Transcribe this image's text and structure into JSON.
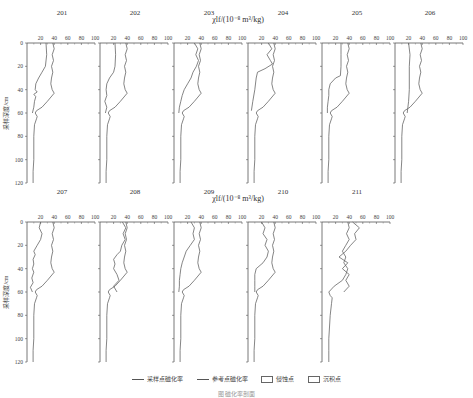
{
  "chart_data": {
    "type": "line",
    "xlabel": "χlf/(10⁻⁸ m³/kg)",
    "ylabel": "采样深度/cm",
    "x_ticks": [
      20,
      40,
      60,
      80,
      100
    ],
    "y_ticks": [
      0,
      20,
      40,
      60,
      80,
      100,
      120
    ],
    "xlim": [
      0,
      100
    ],
    "ylim": [
      0,
      120
    ],
    "y_inverted": true,
    "legend": [
      {
        "type": "line",
        "label": "采样点磁化率"
      },
      {
        "type": "line",
        "label": "参考点磁化率"
      },
      {
        "type": "box",
        "label": "侵蚀点"
      },
      {
        "type": "box",
        "label": "沉积点"
      }
    ],
    "reference_series": {
      "name": "参考点磁化率",
      "depth": [
        0,
        5,
        10,
        15,
        20,
        25,
        30,
        35,
        40,
        43,
        50,
        55,
        58,
        60,
        63,
        65,
        70,
        80,
        90,
        100,
        110,
        120
      ],
      "value": [
        38,
        40,
        37,
        39,
        36,
        38,
        36,
        35,
        37,
        40,
        30,
        22,
        14,
        12,
        15,
        14,
        11,
        10,
        10,
        10,
        9,
        9
      ]
    },
    "panels": [
      {
        "id": "201",
        "row": 0,
        "col": 0,
        "sample": {
          "depth": [
            0,
            10,
            20,
            25,
            30,
            35,
            40,
            42,
            44,
            46,
            50,
            55,
            60
          ],
          "value": [
            28,
            29,
            27,
            22,
            17,
            13,
            12,
            15,
            10,
            13,
            11,
            10,
            8
          ]
        }
      },
      {
        "id": "202",
        "row": 0,
        "col": 1,
        "sample": {
          "depth": [
            0,
            10,
            20,
            25,
            30,
            35,
            40,
            45,
            50,
            55,
            60
          ],
          "value": [
            22,
            23,
            22,
            20,
            14,
            10,
            9,
            10,
            7,
            10,
            8
          ]
        }
      },
      {
        "id": "203",
        "row": 0,
        "col": 2,
        "sample": {
          "depth": [
            0,
            5,
            10,
            15,
            20,
            25,
            30,
            35,
            40,
            45,
            50,
            55,
            60
          ],
          "value": [
            30,
            35,
            32,
            36,
            33,
            28,
            25,
            20,
            15,
            12,
            10,
            8,
            7
          ]
        }
      },
      {
        "id": "204",
        "row": 0,
        "col": 3,
        "sample": {
          "depth": [
            0,
            5,
            10,
            15,
            18,
            22,
            25,
            30,
            40,
            50,
            58
          ],
          "value": [
            30,
            35,
            28,
            33,
            36,
            25,
            14,
            12,
            10,
            7,
            5
          ]
        }
      },
      {
        "id": "205",
        "row": 0,
        "col": 4,
        "sample": {
          "depth": [
            0,
            10,
            20,
            28,
            30,
            35,
            40,
            45,
            50,
            55,
            60
          ],
          "value": [
            28,
            28,
            28,
            27,
            20,
            12,
            10,
            10,
            9,
            8,
            8
          ]
        }
      },
      {
        "id": "206",
        "row": 0,
        "col": 5,
        "sample": {
          "depth": [
            0,
            10,
            20,
            30,
            40,
            50,
            55,
            60
          ],
          "value": [
            20,
            22,
            21,
            21,
            21,
            20,
            19,
            18
          ]
        }
      },
      {
        "id": "207",
        "row": 1,
        "col": 0,
        "sample": {
          "depth": [
            0,
            5,
            10,
            15,
            20,
            25,
            28,
            32,
            36,
            40,
            43,
            48,
            52,
            56,
            60
          ],
          "value": [
            20,
            18,
            22,
            20,
            15,
            10,
            12,
            9,
            10,
            8,
            10,
            7,
            9,
            5,
            8
          ]
        }
      },
      {
        "id": "208",
        "row": 1,
        "col": 1,
        "sample": {
          "depth": [
            0,
            5,
            10,
            15,
            20,
            25,
            28,
            32,
            36,
            40,
            45,
            50,
            55,
            60
          ],
          "value": [
            33,
            38,
            34,
            37,
            32,
            30,
            25,
            20,
            22,
            20,
            25,
            28,
            20,
            25
          ]
        }
      },
      {
        "id": "209",
        "row": 1,
        "col": 2,
        "sample": {
          "depth": [
            0,
            5,
            10,
            15,
            20,
            25,
            30,
            35,
            40,
            45,
            50,
            55,
            60
          ],
          "value": [
            25,
            30,
            28,
            30,
            24,
            18,
            15,
            12,
            10,
            9,
            8,
            8,
            7
          ]
        }
      },
      {
        "id": "210",
        "row": 1,
        "col": 3,
        "sample": {
          "depth": [
            0,
            5,
            10,
            15,
            20,
            25,
            30,
            35,
            40,
            45,
            50,
            55,
            60
          ],
          "value": [
            20,
            25,
            22,
            28,
            25,
            30,
            28,
            22,
            12,
            10,
            10,
            10,
            10
          ]
        }
      },
      {
        "id": "211",
        "row": 1,
        "col": 4,
        "sample": {
          "depth": [
            0,
            5,
            10,
            15,
            20,
            25,
            30,
            35,
            40,
            45,
            50,
            55,
            60
          ],
          "value": [
            45,
            55,
            48,
            50,
            42,
            35,
            25,
            38,
            30,
            40,
            35,
            40,
            32
          ]
        },
        "reference_override": {
          "depth": [
            0,
            5,
            10,
            15,
            20,
            25,
            30,
            35,
            40,
            45,
            50,
            55,
            60,
            63,
            65,
            70,
            80,
            90,
            100,
            110,
            120
          ],
          "value": [
            38,
            40,
            36,
            40,
            35,
            30,
            35,
            32,
            38,
            35,
            30,
            18,
            10,
            12,
            15,
            14,
            12,
            11,
            10,
            10,
            10
          ]
        }
      }
    ]
  },
  "legend": {
    "items": [
      {
        "label": "采样点磁化率"
      },
      {
        "label": "参考点磁化率"
      },
      {
        "label": "侵蚀点"
      },
      {
        "label": "沉积点"
      }
    ]
  },
  "caption": "图    磁化率剖面"
}
